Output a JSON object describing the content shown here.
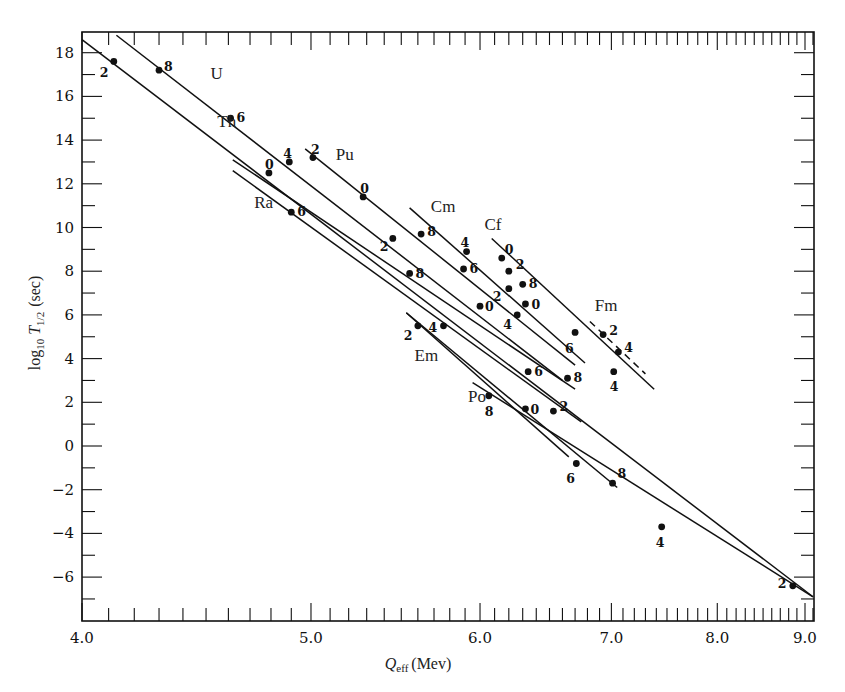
{
  "chart_data": {
    "type": "line",
    "title": "",
    "xlabel": "Q_eff (Mev)",
    "xlabel_main": "Q",
    "xlabel_sub": "eff",
    "xlabel_unit": "(Mev)",
    "ylabel": "log10 T1/2 (sec)",
    "ylabel_main": "log",
    "ylabel_sub1": "10",
    "ylabel_T": "T",
    "ylabel_sub2": "1/2",
    "ylabel_unit": "(sec)",
    "x_scale": "inverse-sqrt (axis linear in 1/sqrt(Q), increasing to the right)",
    "xlim": [
      4.0,
      9.1
    ],
    "ylim": [
      -7.5,
      18.8
    ],
    "x_major_ticks": [
      4.0,
      5.0,
      6.0,
      7.0,
      8.0,
      9.0
    ],
    "x_tick_labels": [
      "4.0",
      "5.0",
      "6.0",
      "7.0",
      "8.0",
      "9.0"
    ],
    "x_minor_step": 0.1,
    "y_major_ticks": [
      18,
      16,
      14,
      12,
      10,
      8,
      6,
      4,
      2,
      0,
      -2,
      -4,
      -6
    ],
    "y_tick_labels": [
      "18",
      "16",
      "14",
      "12",
      "10",
      "8",
      "6",
      "4",
      "2",
      "0",
      "−2",
      "−4",
      "−6"
    ],
    "y_minor_step": 1,
    "grid": false,
    "legend": "none (series labeled inline)",
    "series": [
      {
        "name": "Th",
        "label_pos": [
          4.55,
          14.6
        ],
        "line": [
          [
            4.0,
            18.6
          ],
          [
            9.1,
            -6.9
          ]
        ],
        "points": [
          {
            "q": 4.12,
            "v": 17.6,
            "label": "2",
            "lx": -14,
            "ly": 12
          },
          {
            "q": 4.79,
            "v": 12.5,
            "label": "0",
            "lx": -4,
            "ly": -8
          },
          {
            "q": 6.71,
            "v": -0.8,
            "label": "6",
            "lx": -10,
            "ly": 16
          },
          {
            "q": 7.45,
            "v": -3.7,
            "label": "4",
            "lx": -6,
            "ly": 16
          },
          {
            "q": 8.85,
            "v": -6.4,
            "label": "2",
            "lx": -15,
            "ly": -2
          }
        ]
      },
      {
        "name": "U",
        "label_pos": [
          4.52,
          16.8
        ],
        "line": [
          [
            4.13,
            18.8
          ],
          [
            6.6,
            3.0
          ]
        ],
        "points": [
          {
            "q": 4.3,
            "v": 17.2,
            "label": "8",
            "lx": 5,
            "ly": -3
          },
          {
            "q": 4.61,
            "v": 15.0,
            "label": "6",
            "lx": 6,
            "ly": 0
          },
          {
            "q": 4.89,
            "v": 13.0,
            "label": "4",
            "lx": -6,
            "ly": -8
          },
          {
            "q": 5.45,
            "v": 9.5,
            "label": "2",
            "lx": -13,
            "ly": 9
          },
          {
            "q": 6.34,
            "v": 3.4,
            "label": "6",
            "lx": 6,
            "ly": 0
          }
        ]
      },
      {
        "name": "Ra",
        "label_pos": [
          4.72,
          10.9
        ],
        "line": [
          [
            4.62,
            12.6
          ],
          [
            6.75,
            1.1
          ]
        ],
        "points": [
          {
            "q": 4.9,
            "v": 10.7,
            "label": "6",
            "lx": 6,
            "ly": 0
          },
          {
            "q": 6.0,
            "v": 6.4,
            "label": "0",
            "lx": 5,
            "ly": 1
          },
          {
            "q": 6.53,
            "v": 1.6,
            "label": "2",
            "lx": 6,
            "ly": -4
          }
        ]
      },
      {
        "name": "Th-2",
        "label_pos": null,
        "line": [
          [
            4.62,
            13.1
          ],
          [
            6.7,
            2.6
          ]
        ],
        "points": [
          {
            "q": 5.55,
            "v": 7.9,
            "label": "8",
            "lx": 6,
            "ly": 1
          },
          {
            "q": 6.64,
            "v": 3.1,
            "label": "8",
            "lx": 6,
            "ly": 0
          }
        ]
      },
      {
        "name": "Pu",
        "label_pos": [
          5.13,
          13.1
        ],
        "line": [
          [
            4.97,
            13.6
          ],
          [
            6.7,
            3.7
          ]
        ],
        "points": [
          {
            "q": 5.01,
            "v": 13.2,
            "label": "2",
            "lx": -2,
            "ly": -8
          },
          {
            "q": 5.28,
            "v": 11.4,
            "label": "0",
            "lx": -3,
            "ly": -8
          },
          {
            "q": 5.62,
            "v": 9.7,
            "label": "8",
            "lx": 6,
            "ly": -2
          },
          {
            "q": 5.89,
            "v": 8.1,
            "label": "6",
            "lx": 6,
            "ly": 0
          },
          {
            "q": 6.26,
            "v": 6.0,
            "label": "4",
            "lx": -14,
            "ly": 10
          }
        ]
      },
      {
        "name": "Cm",
        "label_pos": [
          5.68,
          10.7
        ],
        "line": [
          [
            5.55,
            10.9
          ],
          [
            6.78,
            3.8
          ]
        ],
        "points": [
          {
            "q": 5.91,
            "v": 8.9,
            "label": "4",
            "lx": -6,
            "ly": -9
          },
          {
            "q": 6.2,
            "v": 7.2,
            "label": "2",
            "lx": -16,
            "ly": 8
          },
          {
            "q": 6.32,
            "v": 6.5,
            "label": "0",
            "lx": 6,
            "ly": 1
          }
        ]
      },
      {
        "name": "Cf",
        "label_pos": [
          6.03,
          9.9
        ],
        "line": [
          [
            6.08,
            9.5
          ],
          [
            7.38,
            2.6
          ]
        ],
        "points": [
          {
            "q": 6.15,
            "v": 8.6,
            "label": "0",
            "lx": 3,
            "ly": -8
          },
          {
            "q": 6.2,
            "v": 8.0,
            "label": "2",
            "lx": 7,
            "ly": -6
          },
          {
            "q": 6.3,
            "v": 7.4,
            "label": "8",
            "lx": 6,
            "ly": 0
          },
          {
            "q": 6.7,
            "v": 5.2,
            "label": "6",
            "lx": -10,
            "ly": 17
          },
          {
            "q": 7.02,
            "v": 3.4,
            "label": "4",
            "lx": -4,
            "ly": 15
          }
        ]
      },
      {
        "name": "Fm",
        "label_pos": [
          6.86,
          6.2
        ],
        "dashed": true,
        "line": [
          [
            6.82,
            5.7
          ],
          [
            7.3,
            3.3
          ]
        ],
        "points": [
          {
            "q": 6.93,
            "v": 5.1,
            "label": "2",
            "lx": 6,
            "ly": -4
          },
          {
            "q": 7.06,
            "v": 4.3,
            "label": "4",
            "lx": 6,
            "ly": -4
          }
        ]
      },
      {
        "name": "Em",
        "label_pos": [
          5.58,
          3.9
        ],
        "line": [
          [
            5.53,
            6.1
          ],
          [
            6.65,
            -0.5
          ]
        ],
        "points": [
          {
            "q": 5.6,
            "v": 5.5,
            "label": "2",
            "lx": -14,
            "ly": 10
          },
          {
            "q": 5.76,
            "v": 5.5,
            "label": "4",
            "lx": -15,
            "ly": 2
          },
          {
            "q": 6.32,
            "v": 1.7,
            "label": "0",
            "lx": 5,
            "ly": 1
          },
          {
            "q": 7.01,
            "v": -1.7,
            "label": "8",
            "lx": 5,
            "ly": -9
          }
        ]
      },
      {
        "name": "Em-2",
        "label_pos": null,
        "line": [
          [
            5.53,
            6.1
          ],
          [
            7.05,
            -1.9
          ]
        ],
        "points": []
      },
      {
        "name": "Po",
        "label_pos": [
          5.92,
          2.0
        ],
        "line": [
          [
            5.95,
            2.9
          ],
          [
            9.1,
            -6.9
          ]
        ],
        "points": [
          {
            "q": 6.06,
            "v": 2.3,
            "label": "8",
            "lx": -4,
            "ly": 16
          }
        ]
      }
    ]
  }
}
